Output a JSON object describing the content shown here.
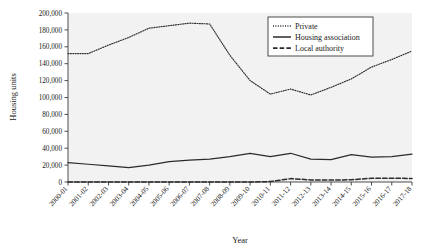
{
  "chart_data": {
    "type": "line",
    "title": "",
    "xlabel": "Year",
    "ylabel": "Housing units",
    "ylim": [
      0,
      200000
    ],
    "yticks": [
      0,
      20000,
      40000,
      60000,
      80000,
      100000,
      120000,
      140000,
      160000,
      180000,
      200000
    ],
    "ytick_labels": [
      "0",
      "20,000",
      "40,000",
      "60,000",
      "80,000",
      "100,000",
      "120,000",
      "140,000",
      "160,000",
      "180,000",
      "200,000"
    ],
    "grid": false,
    "legend_position": "top-right",
    "categories": [
      "2000-01",
      "2001-02",
      "2002-03",
      "2003-04",
      "2004-05",
      "2005-06",
      "2006-07",
      "2007-08",
      "2008-09",
      "2009-10",
      "2010-11",
      "2011-12",
      "2012-13",
      "2013-14",
      "2014-15",
      "2015-16",
      "2016-17",
      "2017-18"
    ],
    "series": [
      {
        "name": "Private",
        "style": "dotted",
        "color": "#2b2b2b",
        "values": [
          152000,
          152000,
          162000,
          171000,
          182000,
          185000,
          188000,
          187000,
          150000,
          120000,
          104000,
          110000,
          103000,
          112000,
          122000,
          136000,
          145000,
          155000
        ]
      },
      {
        "name": "Housing association",
        "style": "solid",
        "color": "#2b2b2b",
        "values": [
          23000,
          21000,
          19000,
          17000,
          20000,
          24000,
          26000,
          27000,
          30000,
          34000,
          30000,
          34000,
          27000,
          26500,
          32500,
          29500,
          30000,
          33000
        ]
      },
      {
        "name": "Local authority",
        "style": "dashed",
        "color": "#2b2b2b",
        "values": [
          0,
          0,
          0,
          0,
          0,
          0,
          0,
          0,
          0,
          0,
          500,
          4000,
          2500,
          2300,
          2600,
          4500,
          4400,
          4200
        ]
      }
    ]
  },
  "legend": {
    "entries": [
      {
        "label": "Private"
      },
      {
        "label": "Housing association"
      },
      {
        "label": "Local authority"
      }
    ]
  }
}
